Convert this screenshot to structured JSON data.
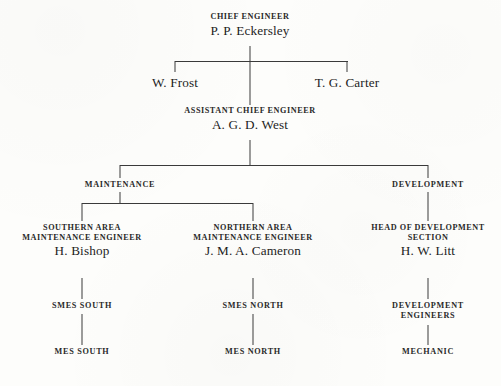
{
  "chart_title": "Organisational chart",
  "nodes": {
    "chief": {
      "role": "CHIEF ENGINEER",
      "name": "P. P. Eckersley"
    },
    "frost": {
      "name": "W. Frost"
    },
    "carter": {
      "name": "T. G. Carter"
    },
    "assistant": {
      "role": "ASSISTANT CHIEF ENGINEER",
      "name": "A. G. D. West"
    },
    "maintenance": {
      "label": "MAINTENANCE"
    },
    "development": {
      "label": "DEVELOPMENT"
    },
    "southern": {
      "role_line1": "SOUTHERN AREA",
      "role_line2": "MAINTENANCE ENGINEER",
      "name": "H. Bishop"
    },
    "northern": {
      "role_line1": "NORTHERN AREA",
      "role_line2": "MAINTENANCE ENGINEER",
      "name": "J. M. A. Cameron"
    },
    "head_development": {
      "role_line1": "HEAD OF DEVELOPMENT",
      "role_line2": "SECTION",
      "name": "H. W. Litt"
    },
    "smes_south": {
      "label": "SMES SOUTH"
    },
    "smes_north": {
      "label": "SMES NORTH"
    },
    "development_engineers": {
      "line1": "DEVELOPMENT",
      "line2": "ENGINEERS"
    },
    "mes_south": {
      "label": "MES SOUTH"
    },
    "mes_north": {
      "label": "MES NORTH"
    },
    "mechanic": {
      "label": "MECHANIC"
    }
  },
  "colors": {
    "ink": "#2a2a2a",
    "line": "#3a3a3a",
    "paper": "#fdfdfb"
  }
}
